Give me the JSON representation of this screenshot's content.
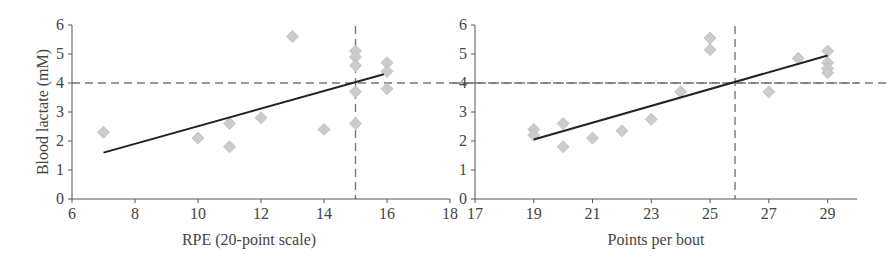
{
  "chart_data": [
    {
      "type": "scatter",
      "title": "",
      "xlabel": "RPE (20-point scale)",
      "ylabel": "Blood lactate (mM)",
      "xlim": [
        6,
        18
      ],
      "ylim": [
        0,
        6
      ],
      "xticks": [
        6,
        8,
        10,
        12,
        14,
        16,
        18
      ],
      "yticks": [
        0,
        1,
        2,
        3,
        4,
        5,
        6
      ],
      "grid": false,
      "legend": null,
      "marker": "diamond",
      "marker_color": "#cccccc",
      "points": [
        {
          "x": 7,
          "y": 2.3
        },
        {
          "x": 10,
          "y": 2.1
        },
        {
          "x": 11,
          "y": 2.6
        },
        {
          "x": 11,
          "y": 1.8
        },
        {
          "x": 12,
          "y": 2.8
        },
        {
          "x": 13,
          "y": 5.6
        },
        {
          "x": 14,
          "y": 2.4
        },
        {
          "x": 15,
          "y": 5.1
        },
        {
          "x": 15,
          "y": 4.9
        },
        {
          "x": 15,
          "y": 4.6
        },
        {
          "x": 15,
          "y": 3.7
        },
        {
          "x": 15,
          "y": 2.6
        },
        {
          "x": 16,
          "y": 4.7
        },
        {
          "x": 16,
          "y": 4.4
        },
        {
          "x": 16,
          "y": 3.8
        }
      ],
      "trendline": {
        "x1": 7,
        "y1": 1.6,
        "x2": 15.9,
        "y2": 4.3,
        "color": "#222222"
      },
      "reference_lines": [
        {
          "orientation": "horizontal",
          "value": 4,
          "style": "dashed"
        },
        {
          "orientation": "vertical",
          "value": 15,
          "style": "dashed"
        }
      ]
    },
    {
      "type": "scatter",
      "title": "",
      "xlabel": "Points per bout",
      "ylabel": "",
      "xlim": [
        17,
        30
      ],
      "ylim": [
        0,
        6
      ],
      "xticks": [
        17,
        19,
        21,
        23,
        25,
        27,
        29
      ],
      "yticks": [
        0,
        1,
        2,
        3,
        4,
        5,
        6
      ],
      "grid": false,
      "legend": null,
      "marker": "diamond",
      "marker_color": "#cccccc",
      "points": [
        {
          "x": 19,
          "y": 2.4
        },
        {
          "x": 19,
          "y": 2.2
        },
        {
          "x": 20,
          "y": 2.6
        },
        {
          "x": 20,
          "y": 1.8
        },
        {
          "x": 21,
          "y": 2.1
        },
        {
          "x": 22,
          "y": 2.35
        },
        {
          "x": 23,
          "y": 2.75
        },
        {
          "x": 24,
          "y": 3.7
        },
        {
          "x": 25,
          "y": 5.55
        },
        {
          "x": 25,
          "y": 5.15
        },
        {
          "x": 27,
          "y": 3.7
        },
        {
          "x": 28,
          "y": 4.85
        },
        {
          "x": 29,
          "y": 5.1
        },
        {
          "x": 29,
          "y": 4.7
        },
        {
          "x": 29,
          "y": 4.5
        },
        {
          "x": 29,
          "y": 4.35
        }
      ],
      "trendline": {
        "x1": 19,
        "y1": 2.05,
        "x2": 29,
        "y2": 4.95,
        "color": "#222222"
      },
      "reference_lines": [
        {
          "orientation": "horizontal",
          "value": 4,
          "style": "dashed"
        },
        {
          "orientation": "vertical",
          "value": 25.85,
          "style": "dashed"
        }
      ]
    }
  ]
}
